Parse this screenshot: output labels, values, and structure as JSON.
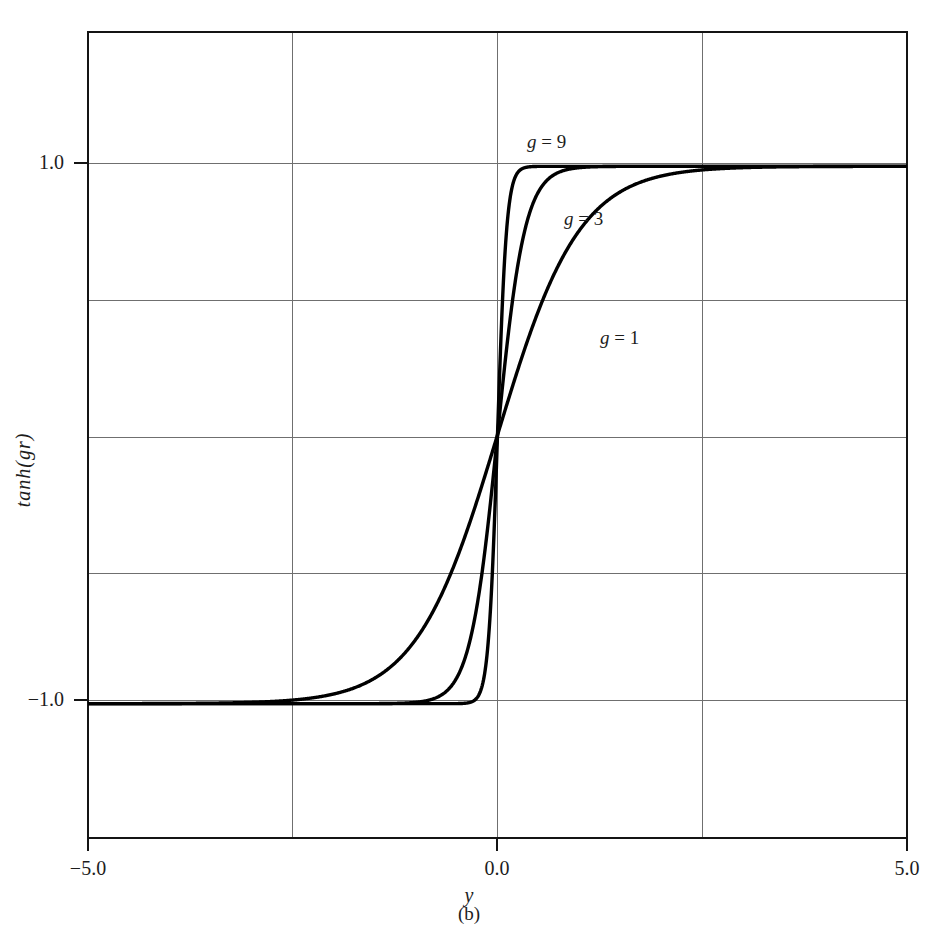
{
  "header": {
    "running_head": ""
  },
  "figure": {
    "panel_label": "(b)",
    "caption": ""
  },
  "axes": {
    "y_axis_title": "tanh(gr)",
    "x_axis_title": "y",
    "y_tick_labels": [
      "1.0",
      "−1.0"
    ],
    "x_tick_labels": [
      "−5.0",
      "0.0",
      "5.0"
    ]
  },
  "annotations": {
    "g9_var": "g",
    "g9_eq": " = 9",
    "g3_var": "g",
    "g3_eq": " = 3",
    "g1_var": "g",
    "g1_eq": " = 1"
  },
  "colors": {
    "curve": "#000000",
    "frame": "#141414",
    "grid": "#6f6f6f",
    "background": "#ffffff",
    "text": "#1c1c1c"
  },
  "chart_data": {
    "type": "line",
    "title": "",
    "subtitle": "(b)",
    "xlabel": "y",
    "ylabel": "tanh(gr)",
    "xlim": [
      -5.0,
      5.0
    ],
    "ylim": [
      -1.5,
      1.5
    ],
    "xticks": [
      -5.0,
      0.0,
      5.0
    ],
    "yticks": [
      1.0,
      -1.0
    ],
    "grid": true,
    "gridlines_x": [
      -5.0,
      -2.5,
      0.0,
      2.5,
      5.0
    ],
    "gridlines_y": [
      1.0,
      0.5,
      0.0,
      -0.5,
      -1.0
    ],
    "legend_position": "inline-annotations",
    "function": "tanh(g*y)",
    "series": [
      {
        "name": "g = 1",
        "gain": 1,
        "label_x": 2.0,
        "label_y": 0.38,
        "x": [
          -5.0,
          -4.5,
          -4.0,
          -3.5,
          -3.0,
          -2.5,
          -2.0,
          -1.75,
          -1.5,
          -1.25,
          -1.0,
          -0.75,
          -0.5,
          -0.25,
          0.0,
          0.25,
          0.5,
          0.75,
          1.0,
          1.25,
          1.5,
          1.75,
          2.0,
          2.5,
          3.0,
          3.5,
          4.0,
          4.5,
          5.0
        ],
        "values": [
          -0.9999,
          -0.9998,
          -0.9993,
          -0.9982,
          -0.9951,
          -0.9866,
          -0.964,
          -0.9414,
          -0.9051,
          -0.8483,
          -0.7616,
          -0.6351,
          -0.4621,
          -0.2449,
          0.0,
          0.2449,
          0.4621,
          0.6351,
          0.7616,
          0.8483,
          0.9051,
          0.9414,
          0.964,
          0.9866,
          0.9951,
          0.9982,
          0.9993,
          0.9998,
          0.9999
        ]
      },
      {
        "name": "g = 3",
        "gain": 3,
        "label_x": 0.45,
        "label_y": 0.78,
        "x": [
          -5.0,
          -4.0,
          -3.0,
          -2.5,
          -2.0,
          -1.75,
          -1.5,
          -1.25,
          -1.0,
          -0.8,
          -0.6,
          -0.4,
          -0.3,
          -0.2,
          -0.1,
          0.0,
          0.1,
          0.2,
          0.3,
          0.4,
          0.6,
          0.8,
          1.0,
          1.25,
          1.5,
          1.75,
          2.0,
          2.5,
          3.0,
          4.0,
          5.0
        ],
        "values": [
          -1.0,
          -1.0,
          -1.0,
          -0.9999,
          -0.9975,
          -0.9947,
          -0.9951,
          -0.9757,
          -0.9951,
          -0.9837,
          -0.9468,
          -0.8337,
          -0.7163,
          -0.537,
          -0.2913,
          0.0,
          0.2913,
          0.537,
          0.7163,
          0.8337,
          0.9468,
          0.9837,
          0.9951,
          0.9988,
          0.9998,
          0.9999,
          0.9999,
          1.0,
          1.0,
          1.0,
          1.0
        ]
      },
      {
        "name": "g = 9",
        "gain": 9,
        "label_x": -0.15,
        "label_y": 1.17,
        "x": [
          -5.0,
          -3.0,
          -1.5,
          -1.0,
          -0.7,
          -0.5,
          -0.4,
          -0.3,
          -0.2,
          -0.15,
          -0.1,
          -0.05,
          0.0,
          0.05,
          0.1,
          0.15,
          0.2,
          0.3,
          0.4,
          0.5,
          0.7,
          1.0,
          1.5,
          3.0,
          5.0
        ],
        "values": [
          -1.0,
          -1.0,
          -1.0,
          -0.9999,
          -0.9982,
          -0.9866,
          -0.964,
          -0.9051,
          -0.7616,
          -0.6351,
          -0.4621,
          -0.2449,
          0.0,
          0.2449,
          0.4621,
          0.6351,
          0.7616,
          0.9051,
          0.964,
          0.9866,
          0.9982,
          0.9999,
          1.0,
          1.0,
          1.0
        ]
      }
    ]
  }
}
